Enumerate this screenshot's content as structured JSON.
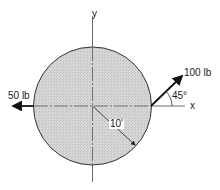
{
  "figure": {
    "type": "free-body diagram",
    "body": {
      "shape": "circle",
      "fill": "#d4d4d4",
      "stroke": "#333333",
      "center_px": [
        92.5,
        106
      ],
      "radius_px": 59
    },
    "axes": {
      "x_label": "x",
      "y_label": "y"
    },
    "forces": [
      {
        "id": "force-100",
        "label": "100 lb",
        "magnitude": 100,
        "unit": "lb",
        "angle_label": "45°",
        "angle_deg": 45,
        "applied_at": "right edge of circle"
      },
      {
        "id": "force-50",
        "label": "50 lb",
        "magnitude": 50,
        "unit": "lb",
        "direction": "negative x",
        "applied_at": "left edge of circle"
      }
    ],
    "dimension": {
      "label": "10'",
      "meaning": "radius"
    }
  }
}
